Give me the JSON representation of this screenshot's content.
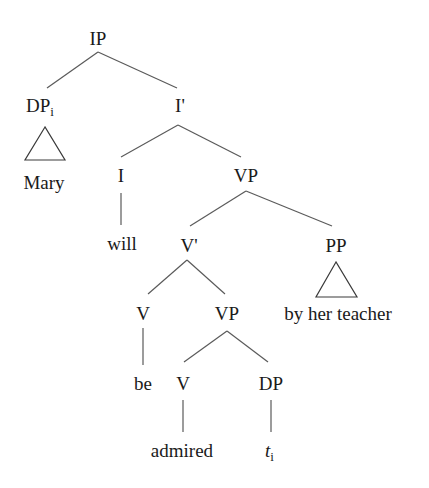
{
  "diagram": {
    "type": "syntax-tree",
    "nodes": {
      "ip": {
        "label": "IP"
      },
      "dp_subject": {
        "label": "DP",
        "subscript": "i"
      },
      "mary": {
        "label": "Mary"
      },
      "i_bar": {
        "label": "I'"
      },
      "i_head": {
        "label": "I"
      },
      "will": {
        "label": "will"
      },
      "vp_upper": {
        "label": "VP"
      },
      "v_bar": {
        "label": "V'"
      },
      "pp": {
        "label": "PP"
      },
      "by_her_teacher": {
        "label": "by her teacher"
      },
      "v_be": {
        "label": "V"
      },
      "be": {
        "label": "be"
      },
      "vp_lower": {
        "label": "VP"
      },
      "v_admired": {
        "label": "V"
      },
      "admired": {
        "label": "admired"
      },
      "dp_object": {
        "label": "DP"
      },
      "trace": {
        "label": "t",
        "subscript": "i"
      }
    },
    "edges": [
      [
        "ip",
        "dp_subject"
      ],
      [
        "ip",
        "i_bar"
      ],
      [
        "dp_subject",
        "mary",
        "triangle"
      ],
      [
        "i_bar",
        "i_head"
      ],
      [
        "i_bar",
        "vp_upper"
      ],
      [
        "i_head",
        "will"
      ],
      [
        "vp_upper",
        "v_bar"
      ],
      [
        "vp_upper",
        "pp"
      ],
      [
        "pp",
        "by_her_teacher",
        "triangle"
      ],
      [
        "v_bar",
        "v_be"
      ],
      [
        "v_bar",
        "vp_lower"
      ],
      [
        "v_be",
        "be"
      ],
      [
        "vp_lower",
        "v_admired"
      ],
      [
        "vp_lower",
        "dp_object"
      ],
      [
        "v_admired",
        "admired"
      ],
      [
        "dp_object",
        "trace"
      ]
    ]
  }
}
